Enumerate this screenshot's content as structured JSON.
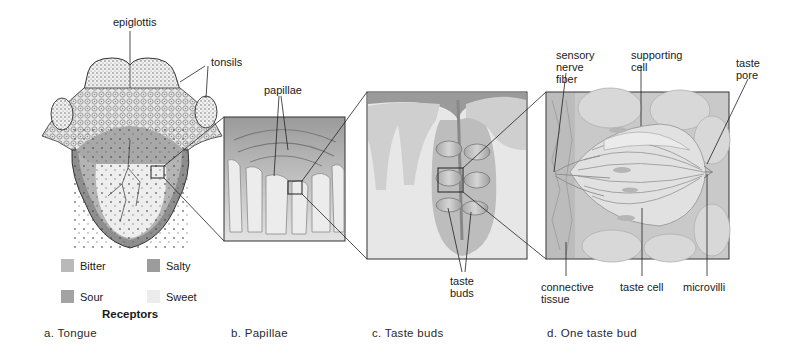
{
  "figure": {
    "panels": [
      {
        "id": "a",
        "caption": "a. Tongue"
      },
      {
        "id": "b",
        "caption": "b. Papillae"
      },
      {
        "id": "c",
        "caption": "c. Taste buds"
      },
      {
        "id": "d",
        "caption": "d. One taste bud"
      }
    ],
    "tongue_labels": {
      "epiglottis": "epiglottis",
      "tonsils": "tonsils"
    },
    "papillae_labels": {
      "papillae": "papillae"
    },
    "taste_buds_labels": {
      "taste_buds_line1": "taste",
      "taste_buds_line2": "buds"
    },
    "taste_bud_labels": {
      "sensory_line1": "sensory",
      "sensory_line2": "nerve",
      "sensory_line3": "fiber",
      "supporting_line1": "supporting",
      "supporting_line2": "cell",
      "pore_line1": "taste",
      "pore_line2": "pore",
      "connective_line1": "connective",
      "connective_line2": "tissue",
      "taste_cell": "taste cell",
      "microvilli": "microvilli"
    },
    "legend": {
      "title": "Receptors",
      "items": [
        {
          "label": "Bitter",
          "color": "#b9b9b9"
        },
        {
          "label": "Salty",
          "color": "#9c9c9c"
        },
        {
          "label": "Sour",
          "color": "#a3a3a3"
        },
        {
          "label": "Sweet",
          "color": "#ececec"
        }
      ]
    },
    "colors": {
      "outline": "#333333",
      "tongue_dark": "#8e8e8e",
      "tongue_mid": "#b4b4b4",
      "tongue_light": "#eeeeee",
      "panel_bg": "#d9d9d9"
    }
  }
}
